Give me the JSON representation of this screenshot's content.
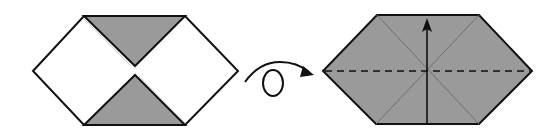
{
  "diagram": {
    "type": "origami-instruction",
    "steps": [
      {
        "id": "step-before",
        "description": "Hexagon with upper and lower shaded triangular flaps folded to center",
        "outline": [
          [
            33,
            71
          ],
          [
            84,
            16
          ],
          [
            185,
            16
          ],
          [
            238,
            71
          ],
          [
            185,
            125
          ],
          [
            84,
            125
          ]
        ],
        "flaps": [
          {
            "name": "top-flap",
            "points": [
              [
                84,
                16
              ],
              [
                185,
                16
              ],
              [
                135,
                66
              ]
            ]
          },
          {
            "name": "bottom-flap",
            "points": [
              [
                84,
                125
              ],
              [
                185,
                125
              ],
              [
                135,
                75
              ]
            ]
          }
        ]
      },
      {
        "id": "step-after",
        "description": "Shaded hexagon with diagonal creases, horizontal valley-fold line and upward fold arrow",
        "outline": [
          [
            323,
            71
          ],
          [
            377,
            15
          ],
          [
            479,
            15
          ],
          [
            532,
            71
          ],
          [
            479,
            124
          ],
          [
            376,
            124
          ]
        ],
        "center": [
          427,
          71
        ],
        "creases": [
          {
            "from": [
              377,
              15
            ],
            "to": [
              479,
              124
            ]
          },
          {
            "from": [
              479,
              15
            ],
            "to": [
              376,
              124
            ]
          }
        ],
        "valley_fold": {
          "from": [
            323,
            71
          ],
          "to": [
            532,
            71
          ],
          "style": "dashed"
        },
        "fold_arrow": {
          "from": [
            427,
            124
          ],
          "to": [
            427,
            19
          ],
          "direction": "up"
        }
      }
    ],
    "turnover_symbol": {
      "name": "turn-over-arrow",
      "meaning": "Turn the model over"
    },
    "colors": {
      "line": "#111111",
      "paper_white": "#ffffff",
      "paper_colored": "#9a9a9a",
      "crease": "#6e6e6e"
    }
  }
}
